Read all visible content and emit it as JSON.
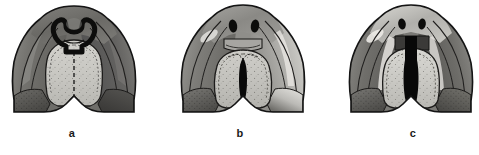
{
  "figure": {
    "caption_present": false,
    "background_color": "#ffffff",
    "panel_count": 3
  },
  "panels": [
    {
      "id": "a",
      "label": "a",
      "x": 8,
      "y": 4,
      "width": 128,
      "height": 118,
      "label_x": 72,
      "label_y": 133,
      "description": "Cephalon in anterior view with heavy black glabellar furrow outline and dashed median axial line on the doublure",
      "tones": {
        "cheek_left": "#6e6e6e",
        "cheek_right": "#5e5e5e",
        "glabella": "#7b7b7b",
        "doublure": "#c8c7c2",
        "genal_dark": "#4a4a4a",
        "outline": "#141414"
      },
      "features": {
        "median_line_style": "dashed",
        "median_opening": "none",
        "glabellar_outline": "thick-black",
        "genal_angle_shading": "dark-stippled"
      }
    },
    {
      "id": "b",
      "label": "b",
      "x": 176,
      "y": 4,
      "width": 130,
      "height": 118,
      "label_x": 240,
      "label_y": 133,
      "description": "Cephalon in anterior view with two dark anterior pits and a narrow elongate black median opening",
      "tones": {
        "cheek_left": "#7a7a7a",
        "cheek_right": "#b9b8b4",
        "glabella": "#8d8d8a",
        "doublure": "#c4c3be",
        "genal_dark": "#575757",
        "outline": "#141414"
      },
      "features": {
        "median_line_style": "solid-black-slot",
        "median_opening": "narrow-elongate",
        "glabellar_outline": "thin-black",
        "genal_angle_shading": "dark-left-light-right"
      }
    },
    {
      "id": "c",
      "label": "c",
      "x": 345,
      "y": 4,
      "width": 128,
      "height": 118,
      "label_x": 413,
      "label_y": 133,
      "description": "Cephalon in anterior view with broad black median opening extending from the rostral plate to the posterior margin",
      "tones": {
        "cheek_left": "#6b6b6b",
        "cheek_right": "#6f6f6f",
        "glabella": "#d2d1cc",
        "doublure": "#c0bfba",
        "genal_dark": "#5a5a5a",
        "outline": "#141414"
      },
      "features": {
        "median_line_style": "solid-black-wide",
        "median_opening": "broad-elongate",
        "glabellar_outline": "thin-black",
        "genal_angle_shading": "dark-stippled"
      }
    }
  ],
  "colors": {
    "ink": "#141414",
    "paper": "#ffffff",
    "label_text": "#1a1a1a"
  }
}
